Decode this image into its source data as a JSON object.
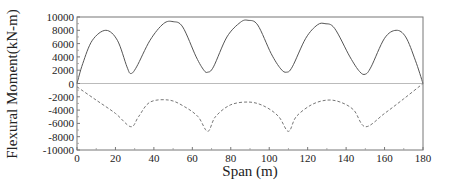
{
  "chart_data": {
    "type": "line",
    "title": "",
    "xlabel": "Span (m)",
    "ylabel": "Flexural Moment(kN-m)",
    "xlim": [
      0,
      180
    ],
    "ylim": [
      -10000,
      10000
    ],
    "xticks": [
      0,
      20,
      40,
      60,
      80,
      100,
      120,
      140,
      160,
      180
    ],
    "yticks": [
      10000,
      8000,
      6000,
      4000,
      2000,
      0,
      -2000,
      -4000,
      -6000,
      -8000,
      -10000
    ],
    "grid": false,
    "legend": null,
    "zero_line": true,
    "series": [
      {
        "name": "positive moment envelope",
        "style": "solid",
        "color": "#555555",
        "x": [
          0,
          3,
          8,
          15,
          21,
          26,
          28,
          31,
          38,
          45,
          50,
          55,
          62,
          66,
          68,
          71,
          78,
          85,
          89,
          94,
          101,
          106,
          109,
          112,
          119,
          125,
          129,
          134,
          142,
          147,
          150,
          153,
          160,
          166,
          171,
          176,
          180
        ],
        "values": [
          0,
          3000,
          6500,
          8000,
          6500,
          2500,
          1500,
          2500,
          6500,
          9000,
          9300,
          8500,
          4000,
          2000,
          1700,
          2500,
          7000,
          9200,
          9500,
          8800,
          4500,
          2200,
          1700,
          2500,
          6800,
          8800,
          9000,
          8300,
          4000,
          1800,
          1400,
          2500,
          6800,
          8000,
          7000,
          3500,
          0
        ]
      },
      {
        "name": "negative moment envelope",
        "style": "dashed",
        "color": "#777777",
        "x": [
          0,
          10,
          20,
          28,
          32,
          38,
          48,
          56,
          63,
          68,
          72,
          80,
          90,
          98,
          105,
          110,
          114,
          122,
          130,
          137,
          144,
          150,
          160,
          170,
          180
        ],
        "values": [
          -500,
          -2500,
          -4500,
          -6500,
          -5000,
          -2800,
          -2500,
          -3500,
          -5000,
          -7200,
          -5000,
          -3200,
          -2800,
          -3500,
          -5000,
          -7200,
          -5000,
          -3200,
          -2500,
          -2800,
          -4000,
          -6500,
          -4500,
          -2300,
          0
        ]
      }
    ]
  }
}
